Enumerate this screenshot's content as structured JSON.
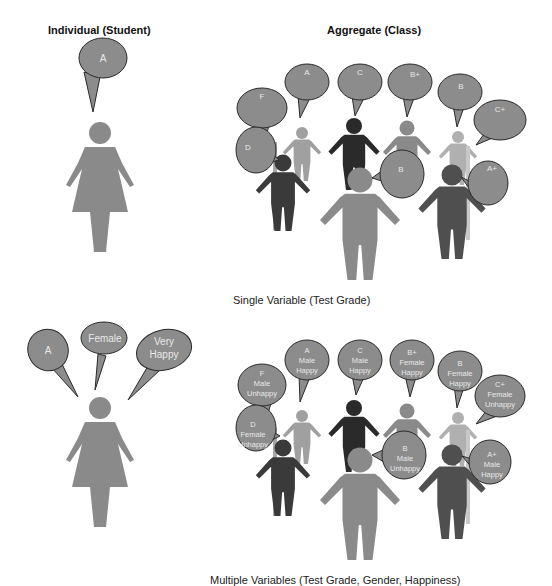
{
  "headers": {
    "individual": "Individual (Student)",
    "aggregate": "Aggregate (Class)"
  },
  "captions": {
    "single": "Single Variable (Test Grade)",
    "multiple": "Multiple Variables (Test Grade, Gender, Happiness)"
  },
  "colors": {
    "bubble_fill": "#8c8c8c",
    "bubble_stroke": "#2a2a2a",
    "figure_mid": "#8a8a8a",
    "figure_light": "#a8a8a8",
    "figure_dark": "#2a2a2a",
    "figure_darkgray": "#4a4a4a"
  },
  "individual_single": {
    "bubble": "A"
  },
  "aggregate_single": {
    "bubbles": [
      "F",
      "A",
      "C",
      "B+",
      "B",
      "C+",
      "D",
      "B",
      "A+"
    ]
  },
  "individual_multi": {
    "bubbles": [
      {
        "lines": [
          "A"
        ]
      },
      {
        "lines": [
          "Female"
        ]
      },
      {
        "lines": [
          "Very",
          "Happy"
        ]
      }
    ]
  },
  "aggregate_multi": {
    "bubbles": [
      {
        "lines": [
          "F",
          "Male",
          "Unhappy"
        ]
      },
      {
        "lines": [
          "A",
          "Male",
          "Happy"
        ]
      },
      {
        "lines": [
          "C",
          "Male",
          "Happy"
        ]
      },
      {
        "lines": [
          "B+",
          "Female",
          "Happy"
        ]
      },
      {
        "lines": [
          "B",
          "Female",
          "Happy"
        ]
      },
      {
        "lines": [
          "C+",
          "Female",
          "Unhappy"
        ]
      },
      {
        "lines": [
          "D",
          "Female",
          "Unhappy"
        ]
      },
      {
        "lines": [
          "B",
          "Male",
          "Unhappy"
        ]
      },
      {
        "lines": [
          "A+",
          "Male",
          "Happy"
        ]
      }
    ]
  }
}
